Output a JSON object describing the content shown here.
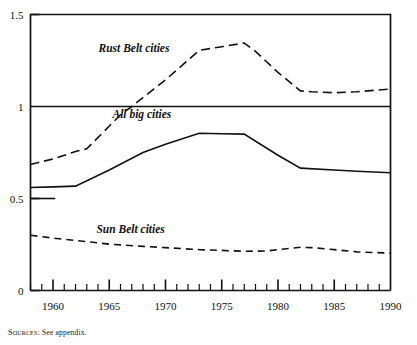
{
  "figure": {
    "source_note_prefix": "Sources:",
    "source_note_text": " See appendix."
  },
  "chart_data": {
    "type": "line",
    "title": "",
    "subtitle": "",
    "xlabel": "",
    "ylabel": "",
    "xlim": [
      1958,
      1990
    ],
    "ylim": [
      0,
      1.5
    ],
    "grid": false,
    "legend_position": "inline-annotation",
    "x_major_ticks": [
      1960,
      1965,
      1970,
      1975,
      1980,
      1985,
      1990
    ],
    "x_major_tick_labels": [
      "1960",
      "1965",
      "1970",
      "1975",
      "1980",
      "1985",
      "1990"
    ],
    "x_minor_tick_interval": 1,
    "y_ticks": [
      0,
      0.5,
      1,
      1.5
    ],
    "y_tick_labels": [
      "0",
      "0.5",
      "1",
      "1.5"
    ],
    "reference_line_y": 1,
    "annotations": [
      {
        "text": "Rust Belt cities",
        "x": 1967.2,
        "y": 1.295
      },
      {
        "text": "All big cities",
        "x": 1967.9,
        "y": 0.935
      },
      {
        "text": "Sun Belt cities",
        "x": 1966.9,
        "y": 0.315
      },
      {
        "text": "0.5",
        "x": 1958.8,
        "y": 0.5
      }
    ],
    "series": [
      {
        "name": "Rust Belt cities",
        "style": "dashed",
        "dash_pattern": "9,5",
        "line_width": 1.6,
        "color": "#111111",
        "x": [
          1958,
          1960,
          1962,
          1963,
          1966,
          1967,
          1970,
          1973,
          1975,
          1977,
          1978,
          1980,
          1982,
          1983,
          1985,
          1987,
          1990
        ],
        "values": [
          0.685,
          0.715,
          0.755,
          0.77,
          0.955,
          1.0,
          1.145,
          1.305,
          1.325,
          1.345,
          1.3,
          1.185,
          1.085,
          1.08,
          1.075,
          1.08,
          1.095
        ]
      },
      {
        "name": "All big cities",
        "style": "solid",
        "dash_pattern": "",
        "line_width": 1.6,
        "color": "#111111",
        "x": [
          1958,
          1960,
          1962,
          1965,
          1968,
          1970,
          1973,
          1975,
          1977,
          1980,
          1982,
          1985,
          1987,
          1990
        ],
        "values": [
          0.56,
          0.563,
          0.567,
          0.655,
          0.75,
          0.795,
          0.855,
          0.852,
          0.85,
          0.735,
          0.665,
          0.655,
          0.648,
          0.64
        ]
      },
      {
        "name": "Sun Belt cities",
        "style": "dashed",
        "dash_pattern": "7,5",
        "line_width": 1.6,
        "color": "#111111",
        "x": [
          1958,
          1960,
          1962,
          1965,
          1968,
          1970,
          1973,
          1975,
          1977,
          1979,
          1980,
          1982,
          1983,
          1985,
          1987,
          1990
        ],
        "values": [
          0.3,
          0.285,
          0.272,
          0.252,
          0.24,
          0.233,
          0.222,
          0.218,
          0.213,
          0.215,
          0.222,
          0.235,
          0.233,
          0.222,
          0.21,
          0.203
        ]
      },
      {
        "name": "axis-stub-0.5",
        "style": "solid",
        "dash_pattern": "",
        "line_width": 1.6,
        "color": "#111111",
        "x": [
          1958,
          1960.2
        ],
        "values": [
          0.5,
          0.5
        ]
      }
    ]
  }
}
